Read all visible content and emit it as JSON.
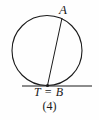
{
  "figure": {
    "caption": "(4)",
    "background_color": "#fefefe",
    "stroke_color": "#1a1a1a",
    "labels": {
      "point_a": "A",
      "tangent_point": "T = B"
    },
    "geometry": {
      "circle": {
        "cx": 47,
        "cy": 50.5,
        "r": 35
      },
      "chord": {
        "x1": 62,
        "y1": 18,
        "x2": 47.5,
        "y2": 85.5
      },
      "tangent_line": {
        "x1": 22,
        "y1": 86,
        "x2": 92,
        "y2": 86
      },
      "marked_point": {
        "cx": 47.5,
        "cy": 85.5,
        "r": 1.6
      }
    }
  }
}
